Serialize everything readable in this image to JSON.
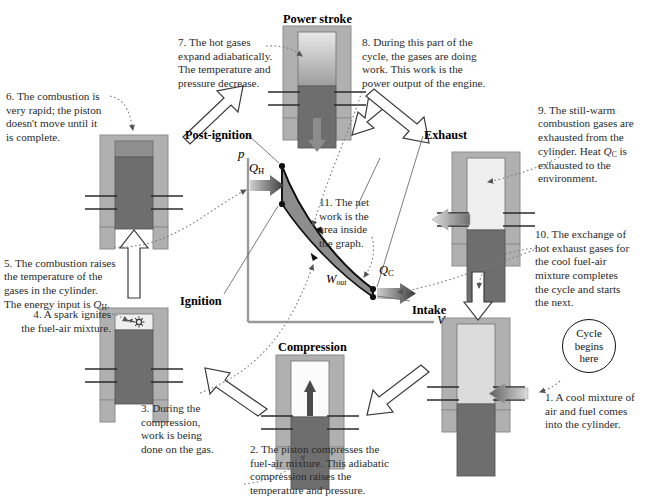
{
  "diagram": {
    "colors": {
      "cylinder_wall": "#b3b3b3",
      "piston": "#6e6e6e",
      "gas_hot": "#8f8f8f",
      "gas_warm": "#d4d4d4",
      "gas_cool": "#f2f2f2",
      "curve_fill": "#8d8d8d",
      "axis": "#9a9a9a",
      "arrow_outline": "#2b2b2b",
      "text": "#2a2a2a"
    }
  },
  "stage_labels": [
    {
      "name": "power-stroke",
      "text": "Power stroke",
      "x": 283,
      "y": 12
    },
    {
      "name": "post-ignition",
      "text": "Post-ignition",
      "x": 185,
      "y": 128
    },
    {
      "name": "exhaust",
      "text": "Exhaust",
      "x": 424,
      "y": 128
    },
    {
      "name": "ignition",
      "text": "Ignition",
      "x": 180,
      "y": 294
    },
    {
      "name": "intake",
      "text": "Intake",
      "x": 412,
      "y": 303
    },
    {
      "name": "compression",
      "text": "Compression",
      "x": 278,
      "y": 340
    }
  ],
  "notes": [
    {
      "id": 1,
      "name": "note-cool-mixture",
      "text": "1. A cool mixture of\nair and fuel comes\ninto the cylinder.",
      "x": 545,
      "y": 391,
      "width": 100,
      "align": "left"
    },
    {
      "id": 2,
      "name": "note-piston-compresses",
      "text": "2. The piston compresses the\nfuel-air mixture.  This adiabatic\ncompression raises the\ntemperature and pressure.",
      "x": 250,
      "y": 443,
      "width": 190,
      "align": "left"
    },
    {
      "id": 3,
      "name": "note-work-done-on-gas",
      "text": "3. During the\ncompression,\nwork is being\ndone on the gas.",
      "x": 141,
      "y": 402,
      "width": 95,
      "align": "left"
    },
    {
      "id": 4,
      "name": "note-spark-ignites",
      "text": "4. A spark ignites\nthe fuel-air mixture.",
      "x": 6,
      "y": 308,
      "width": 105,
      "align": "right"
    },
    {
      "id": 5,
      "name": "note-combustion-raises-temp",
      "text": "5. The combustion raises\nthe temperature of the\ngases in the cylinder.\nThe energy input is Q_H.",
      "x": 4,
      "y": 243,
      "width": 125,
      "align": "left"
    },
    {
      "id": 6,
      "name": "note-combustion-rapid",
      "text": "6. The combustion is\nvery rapid; the piston\ndoesn't move until it\nis complete.",
      "x": 6,
      "y": 90,
      "width": 118,
      "align": "left"
    },
    {
      "id": 7,
      "name": "note-hot-gases-expand",
      "text": "7. The hot gases\nexpand adiabatically.\nThe temperature and\npressure decrease.",
      "x": 178,
      "y": 36,
      "width": 110,
      "align": "left"
    },
    {
      "id": 8,
      "name": "note-gases-doing-work",
      "text": "8. During this part of the\ncycle, the gases are doing\nwork. This work is the\npower output of the engine.",
      "x": 362,
      "y": 36,
      "width": 150,
      "align": "left"
    },
    {
      "id": 9,
      "name": "note-still-warm-gases",
      "text": "9. The still-warm\ncombustion gases are\nexhausted from the\ncylinder. Heat Q_C is\nexhausted to the\nenvironment.",
      "x": 538,
      "y": 90,
      "width": 107,
      "align": "left"
    },
    {
      "id": 10,
      "name": "note-exchange-of-gases",
      "text": "10. The exchange of\nhot exhaust gases for\nthe cool fuel-air\nmixture completes\nthe cycle and starts\nthe next.",
      "x": 535,
      "y": 228,
      "width": 110,
      "align": "left"
    },
    {
      "id": 11,
      "name": "note-net-work-area",
      "text": "11. The net\nwork is the\narea inside\nthe graph.",
      "x": 319,
      "y": 196,
      "width": 70,
      "align": "left"
    }
  ],
  "note_fragments": {
    "note5_prefix": "5. The combustion raises\nthe temperature of the\ngases in the cylinder.\nThe energy input is ",
    "note5_symbol": "Q",
    "note5_sub": "H",
    "note5_suffix": ".",
    "note9_prefix": "9. The still-warm\ncombustion gases are\nexhausted from the\ncylinder. Heat ",
    "note9_symbol": "Q",
    "note9_sub": "C",
    "note9_suffix": " is\nexhausted to the\nenvironment."
  },
  "pv_diagram": {
    "name": "pressure-volume-graph",
    "axis_p_label": "p",
    "axis_v_label": "V",
    "q_hot_label": "Q",
    "q_hot_sub": "H",
    "q_cold_label": "Q",
    "q_cold_sub": "C",
    "w_out_label": "W",
    "w_out_sub": "out",
    "origin": {
      "x": 248,
      "y": 322
    },
    "axis_top": {
      "x": 248,
      "y": 158
    },
    "axis_right": {
      "x": 432,
      "y": 322
    },
    "points": {
      "top_left": {
        "x": 282,
        "y": 166,
        "name": "post-ignition-state"
      },
      "bottom_left": {
        "x": 282,
        "y": 204,
        "name": "ignition-state"
      },
      "top_right": {
        "x": 373,
        "y": 289,
        "name": "exhaust-state"
      },
      "bottom_right": {
        "x": 373,
        "y": 297,
        "name": "intake-state"
      }
    }
  },
  "cycle_badge": {
    "name": "cycle-begins-here",
    "line1": "Cycle",
    "line2": "begins",
    "line3": "here",
    "x": 562,
    "y": 319
  },
  "cylinders": [
    {
      "name": "cylinder-power-stroke",
      "x": 283,
      "y": 26,
      "gas": "gradient",
      "piston_top": 58,
      "piston_height": 62,
      "arrow": "down-below"
    },
    {
      "name": "cylinder-post-ignition",
      "x": 100,
      "y": 135,
      "gas": "hot",
      "piston_top": 22,
      "piston_height": 72,
      "arrow": "none"
    },
    {
      "name": "cylinder-exhaust",
      "x": 452,
      "y": 152,
      "gas": "cool",
      "piston_top": 78,
      "piston_height": 72,
      "arrow": "left-out"
    },
    {
      "name": "cylinder-ignition",
      "x": 100,
      "y": 308,
      "gas": "cool-spark",
      "piston_top": 24,
      "piston_height": 74,
      "arrow": "none"
    },
    {
      "name": "cylinder-compression",
      "x": 276,
      "y": 355,
      "gas": "white-up",
      "piston_top": 62,
      "piston_height": 72,
      "arrow": "up-inside"
    },
    {
      "name": "cylinder-intake",
      "x": 442,
      "y": 318,
      "gas": "cool",
      "piston_top": 86,
      "piston_height": 72,
      "arrow": "right-in"
    }
  ],
  "icons": {
    "spark": "spark-icon",
    "up_arrow": "up-arrow-icon",
    "down_arrow": "down-arrow-icon",
    "left_arrow": "left-arrow-icon",
    "right_arrow": "right-arrow-icon"
  }
}
